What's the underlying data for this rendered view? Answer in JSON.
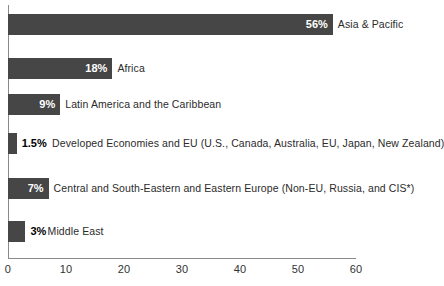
{
  "chart_data": {
    "type": "bar",
    "orientation": "horizontal",
    "title": "",
    "subtitle": "",
    "xlabel": "",
    "ylabel": "",
    "xlim": [
      0,
      60
    ],
    "grid": false,
    "legend": "none",
    "axis_ticks": [
      "0",
      "10",
      "20",
      "30",
      "40",
      "50",
      "60"
    ],
    "tick_values": [
      0,
      10,
      20,
      30,
      40,
      50,
      60
    ],
    "categories": [
      "Asia & Pacific",
      "Africa",
      "Latin America and the Caribbean",
      "Developed Economies and EU (U.S., Canada, Australia, EU, Japan, New Zealand)",
      "Central and South-Eastern and Eastern Europe (Non-EU, Russia, and CIS*)",
      "Middle East"
    ],
    "values": [
      56,
      18,
      9,
      1.5,
      7,
      3
    ],
    "value_labels": [
      "56%",
      "18%",
      "9%",
      "1.5%",
      "7%",
      "3%"
    ],
    "bars": [
      {
        "category": "Asia & Pacific",
        "value": 56,
        "value_label": "56%",
        "label_position": "inside",
        "label_color": "#ffffff"
      },
      {
        "category": "Africa",
        "value": 18,
        "value_label": "18%",
        "label_position": "inside",
        "label_color": "#ffffff"
      },
      {
        "category": "Latin America and the Caribbean",
        "value": 9,
        "value_label": "9%",
        "label_position": "inside",
        "label_color": "#ffffff"
      },
      {
        "category": "Developed Economies and EU (U.S., Canada, Australia, EU, Japan, New Zealand)",
        "value": 1.5,
        "value_label": "1.5%",
        "label_position": "outside",
        "label_color": "#000000"
      },
      {
        "category": "Central and South-Eastern and Eastern Europe (Non-EU, Russia, and CIS*)",
        "value": 7,
        "value_label": "7%",
        "label_position": "inside",
        "label_color": "#ffffff"
      },
      {
        "category": "Middle East",
        "value": 3,
        "value_label": "3%",
        "label_position": "outside",
        "label_color": "#000000"
      }
    ],
    "colors": {
      "bar_fill": "#464646",
      "axis_line": "#8a8a8a",
      "tick_text": "#333333",
      "category_text": "#2b2b2b",
      "background": "#ffffff"
    }
  }
}
